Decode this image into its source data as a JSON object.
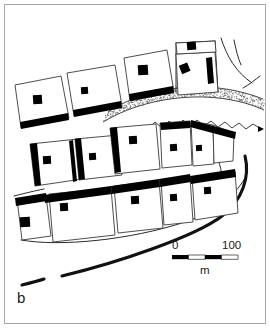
{
  "figure": {
    "panel_label": "b",
    "type": "archaeological-site-plan"
  },
  "scale_bar": {
    "min_label": "0",
    "max_label": "100",
    "unit_label": "m",
    "segments": 4,
    "length_px": 66,
    "x": 172,
    "y": 255
  },
  "colors": {
    "ink": "#000000",
    "outline": "#3a3a3a",
    "frame": "#a8a8a8",
    "stipple": "#6f6f6f",
    "paper": "#ffffff"
  },
  "map": {
    "frame": {
      "x": 4,
      "y": 4,
      "w": 262,
      "h": 320
    },
    "enclosures": [
      {
        "id": "r1-c1",
        "points": "15,85 61,76 69,119 20,128",
        "wall": "15,127 68,118 69,124 16,133",
        "hearth": {
          "x": 31,
          "y": 97,
          "w": 8,
          "h": 8,
          "rot": -3
        }
      },
      {
        "id": "r1-c2",
        "points": "66,74 114,65 121,107 72,117",
        "wall": "71,112 120,103 121,109 72,118",
        "hearth": {
          "x": 80,
          "y": 87,
          "w": 7,
          "h": 7,
          "rot": -3
        }
      },
      {
        "id": "r1-c3",
        "points": "124,58 166,50 173,93 128,101",
        "wall": "127,95 172,87 173,93 128,101",
        "hearth": {
          "x": 139,
          "y": 66,
          "w": 9,
          "h": 9,
          "rot": -3
        }
      },
      {
        "id": "r1-c4",
        "points": "172,48 214,44 217,88 175,92",
        "wall": "173,48 214,44 214,50 174,54",
        "hearth": {
          "x": 181,
          "y": 67,
          "w": 8,
          "h": 8,
          "rot": -20
        }
      },
      {
        "id": "r1-c5-upper",
        "points": "176,43 213,41 215,52 178,54",
        "hearth": {
          "x": 188,
          "y": 45,
          "w": 8,
          "h": 7,
          "rot": -4
        }
      },
      {
        "id": "r2-c1",
        "points": "30,144 77,139 81,179 34,185",
        "wall": "31,144 37,143 41,184 35,185",
        "hearth": {
          "x": 43,
          "y": 157,
          "w": 7,
          "h": 7,
          "rot": -2
        }
      },
      {
        "id": "r2-c2",
        "points": "74,140 118,136 121,175 78,180",
        "wall": "75,140 81,139 85,179 79,180",
        "hearth": {
          "x": 86,
          "y": 153,
          "w": 7,
          "h": 7,
          "rot": -2
        }
      },
      {
        "id": "r2-c3",
        "points": "110,128 155,124 159,169 114,174",
        "wall": "111,128 118,127 121,171 115,172",
        "hearth": {
          "x": 129,
          "y": 137,
          "w": 8,
          "h": 8,
          "rot": -2
        }
      },
      {
        "id": "r2-c4",
        "points": "158,123 188,120 191,165 161,168",
        "wall": "158,123 188,120 188,127 159,130",
        "hearth": {
          "x": 169,
          "y": 145,
          "w": 7,
          "h": 7,
          "rot": -2
        }
      },
      {
        "id": "r2-c5",
        "points": "186,120 212,123 213,164 188,166",
        "wall": "186,120 213,126 212,133 186,127",
        "hearth": {
          "x": 194,
          "y": 146,
          "w": 6,
          "h": 6,
          "rot": -2
        }
      },
      {
        "id": "r2-c6",
        "points": "206,124 232,133 231,161 209,163",
        "wall": "206,124 233,132 232,139 206,131"
      },
      {
        "id": "r3-c1",
        "points": "16,198 45,196 50,236 21,239",
        "wall": "16,198 45,194 46,201 17,205",
        "hearth": {
          "x": 21,
          "y": 218,
          "w": 9,
          "h": 9,
          "rot": -2
        }
      },
      {
        "id": "r3-c2",
        "points": "48,194 110,189 114,235 52,241",
        "wall": "43,195 110,187 111,194 44,202",
        "hearth": {
          "x": 61,
          "y": 205,
          "w": 7,
          "h": 7,
          "rot": -2
        }
      },
      {
        "id": "r3-c3",
        "points": "113,186 158,182 162,227 117,232",
        "wall": "110,186 158,180 159,188 111,194",
        "hearth": {
          "x": 131,
          "y": 198,
          "w": 8,
          "h": 8,
          "rot": -2
        }
      },
      {
        "id": "r3-c4",
        "points": "160,180 189,178 192,222 163,224",
        "wall": "159,179 189,175 190,183 160,186",
        "hearth": {
          "x": 169,
          "y": 196,
          "w": 7,
          "h": 7,
          "rot": -2
        }
      },
      {
        "id": "r3-c5",
        "points": "191,177 234,172 237,214 194,220",
        "wall": "190,176 234,170 235,178 191,184",
        "hearth": {
          "x": 203,
          "y": 188,
          "w": 7,
          "h": 7,
          "rot": -2
        }
      }
    ],
    "standing_stones": [
      {
        "id": "stone-a",
        "points": "73,140 79,139 83,180 77,181"
      },
      {
        "id": "stone-b",
        "points": "207,58 213,57 215,82 209,83"
      }
    ],
    "tracks": [
      {
        "id": "main-track-south",
        "d": "M 22 277 L 42 272",
        "style": "thick"
      },
      {
        "id": "main-track-south-2",
        "d": "M 46 270 C 100 257 160 240 205 222 C 225 213 240 197 245 178",
        "style": "thick"
      },
      {
        "id": "compound-edge-lower",
        "d": "M 17 205 C 60 222 140 220 190 210 C 215 205 236 192 245 175",
        "style": "thin"
      },
      {
        "id": "compound-edge-mid",
        "d": "M 14 194 C 30 191 34 190 45 188",
        "style": "thin"
      },
      {
        "id": "ridge-right",
        "d": "M 218 160 C 222 172 222 182 218 192",
        "style": "thin"
      },
      {
        "id": "field-line-ne",
        "d": "M 221 40 C 227 58 236 72 252 82",
        "style": "thin"
      },
      {
        "id": "field-line-ne2",
        "d": "M 232 41 L 235 57",
        "style": "thin"
      },
      {
        "id": "field-line-ne3",
        "d": "M 245 86 C 252 82 256 79 259 77",
        "style": "thin"
      }
    ],
    "wadi": {
      "id": "stippled-wadi-band",
      "upper_edge": "M 108 112 C 135 94 170 86 205 87 C 228 88 248 93 263 99",
      "lower_edge": "M 103 122 C 133 104 170 96 205 97 C 229 98 249 103 264 110",
      "wavy_channel": "M 150 128 L 157 122 L 164 127 L 171 121 L 178 126 L 185 120 L 192 125 L 199 120 L 206 125 L 213 121 L 220 126 L 227 122 L 234 127 L 241 123 L 248 128 L 255 124 L 262 129",
      "arrow_tip": {
        "x": 262,
        "y": 128
      }
    }
  }
}
